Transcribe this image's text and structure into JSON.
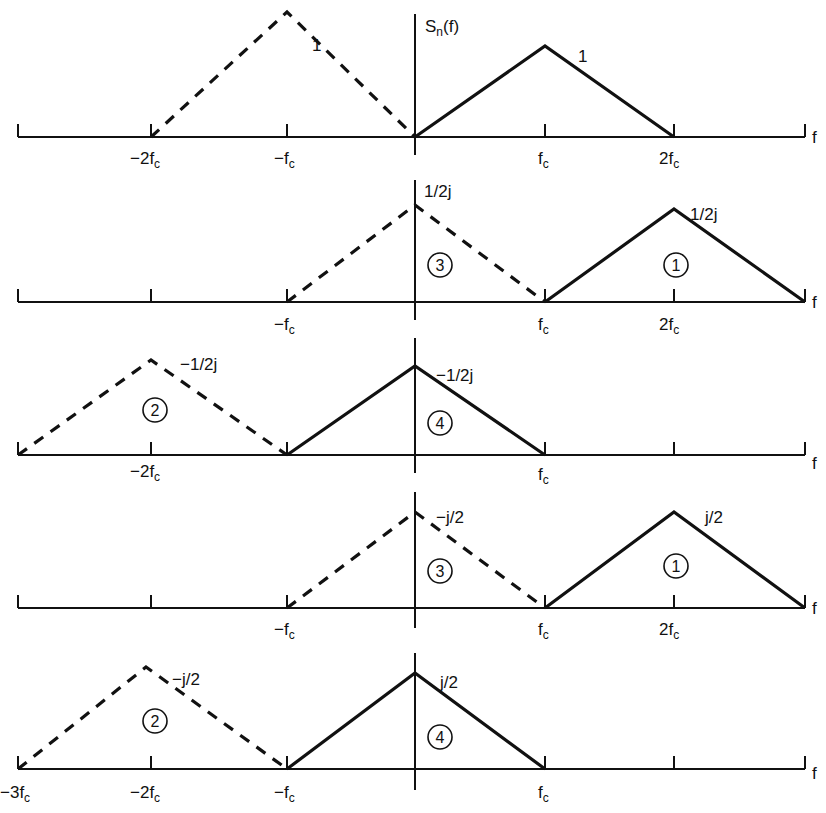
{
  "figure": {
    "y_axis_label": "S",
    "y_axis_label_sub": "n",
    "y_axis_label_tail": "(f)",
    "x_axis_label": "f",
    "panels": [
      {
        "id": "panel-1",
        "peak_labels": [
          "1",
          "1"
        ],
        "tick_labels": [
          {
            "main": "−2f",
            "sub": "c"
          },
          {
            "main": "−f",
            "sub": "c"
          },
          {
            "main": "f",
            "sub": "c"
          },
          {
            "main": "2f",
            "sub": "c"
          }
        ]
      },
      {
        "id": "panel-2",
        "peak_labels": [
          "1/2j",
          "1/2j"
        ],
        "circle_labels": [
          "3",
          "1"
        ],
        "tick_labels": [
          {
            "main": "−f",
            "sub": "c"
          },
          {
            "main": "f",
            "sub": "c"
          },
          {
            "main": "2f",
            "sub": "c"
          }
        ]
      },
      {
        "id": "panel-3",
        "peak_labels": [
          "−1/2j",
          "−1/2j"
        ],
        "circle_labels": [
          "2",
          "4"
        ],
        "tick_labels": [
          {
            "main": "−2f",
            "sub": "c"
          },
          {
            "main": "f",
            "sub": "c"
          }
        ]
      },
      {
        "id": "panel-4",
        "peak_labels": [
          "−j/2",
          "j/2"
        ],
        "circle_labels": [
          "3",
          "1"
        ],
        "tick_labels": [
          {
            "main": "−f",
            "sub": "c"
          },
          {
            "main": "f",
            "sub": "c"
          },
          {
            "main": "2f",
            "sub": "c"
          }
        ]
      },
      {
        "id": "panel-5",
        "peak_labels": [
          "−j/2",
          "j/2"
        ],
        "circle_labels": [
          "2",
          "4"
        ],
        "tick_labels": [
          {
            "main": "−3f",
            "sub": "c"
          },
          {
            "main": "−2f",
            "sub": "c"
          },
          {
            "main": "−f",
            "sub": "c"
          },
          {
            "main": "f",
            "sub": "c"
          }
        ]
      }
    ]
  }
}
